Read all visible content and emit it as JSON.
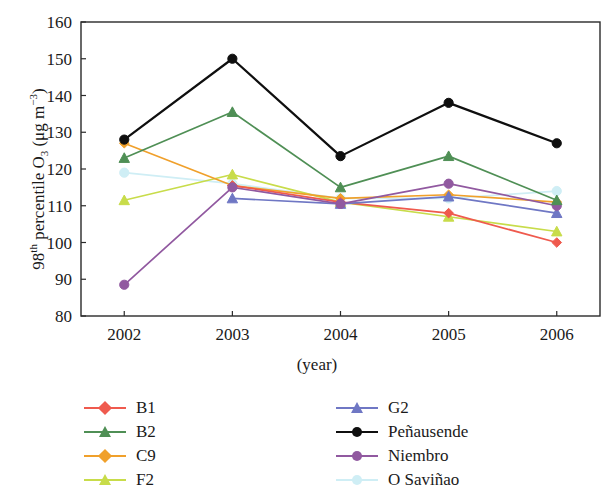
{
  "chart_data": {
    "type": "line",
    "title": "",
    "xlabel": "(year)",
    "ylabel_html": "98<sup>th</sup> percentile O<sub>3</sub> (μg m<sup>−3</sup>)",
    "ylabel_text": "98th percentile O3 (µg m−3)",
    "categories": [
      "2002",
      "2003",
      "2004",
      "2005",
      "2006"
    ],
    "x": [
      2002,
      2003,
      2004,
      2005,
      2006
    ],
    "ylim": [
      80,
      160
    ],
    "xlim": [
      2001.6,
      2006.4
    ],
    "yticks": [
      80,
      90,
      100,
      110,
      120,
      130,
      140,
      150,
      160
    ],
    "grid": false,
    "legend_position": "below-plot, two columns",
    "series": [
      {
        "name": "B1",
        "color": "#ef5a4e",
        "marker": "diamond",
        "values": [
          null,
          115.5,
          111.0,
          108.0,
          100.0
        ]
      },
      {
        "name": "B2",
        "color": "#4f8f55",
        "marker": "triangle",
        "values": [
          123.0,
          135.5,
          115.0,
          123.5,
          111.5
        ]
      },
      {
        "name": "C9",
        "color": "#f0a02b",
        "marker": "diamond",
        "values": [
          127.0,
          115.5,
          112.0,
          113.0,
          111.0
        ]
      },
      {
        "name": "F2",
        "color": "#c8dc4a",
        "marker": "triangle",
        "values": [
          111.5,
          118.5,
          111.0,
          107.0,
          103.0
        ]
      },
      {
        "name": "G2",
        "color": "#6f77c4",
        "marker": "triangle",
        "values": [
          null,
          112.0,
          110.5,
          112.5,
          108.0
        ]
      },
      {
        "name": "Peñausende",
        "color": "#0f0f0f",
        "marker": "circle",
        "values": [
          128.0,
          150.0,
          123.5,
          138.0,
          127.0
        ]
      },
      {
        "name": "Niembro",
        "color": "#9159a0",
        "marker": "circle",
        "values": [
          88.5,
          115.0,
          110.5,
          116.0,
          110.0
        ]
      },
      {
        "name": "O Saviñao",
        "color": "#cfeef5",
        "marker": "circle",
        "values": [
          119.0,
          116.0,
          112.0,
          112.0,
          114.0
        ]
      }
    ]
  },
  "legend": {
    "left_column": [
      {
        "label": "B1",
        "color": "#ef5a4e",
        "marker": "diamond"
      },
      {
        "label": "B2",
        "color": "#4f8f55",
        "marker": "triangle"
      },
      {
        "label": "C9",
        "color": "#f0a02b",
        "marker": "diamond"
      },
      {
        "label": "F2",
        "color": "#c8dc4a",
        "marker": "triangle"
      }
    ],
    "right_column": [
      {
        "label": "G2",
        "color": "#6f77c4",
        "marker": "triangle"
      },
      {
        "label": "Peñausende",
        "color": "#0f0f0f",
        "marker": "circle"
      },
      {
        "label": "Niembro",
        "color": "#9159a0",
        "marker": "circle"
      },
      {
        "label": "O Saviñao",
        "color": "#cfeef5",
        "marker": "circle"
      }
    ]
  },
  "axes": {
    "x_tick_labels": [
      "2002",
      "2003",
      "2004",
      "2005",
      "2006"
    ],
    "y_tick_labels": [
      "80",
      "90",
      "100",
      "110",
      "120",
      "130",
      "140",
      "150",
      "160"
    ],
    "x_axis_title": "(year)"
  }
}
